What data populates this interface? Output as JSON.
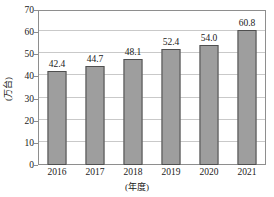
{
  "chart_data": {
    "type": "bar",
    "title": "",
    "categories": [
      "2016",
      "2017",
      "2018",
      "2019",
      "2020",
      "2021"
    ],
    "values": [
      42.4,
      44.7,
      48.1,
      52.4,
      54.0,
      60.8
    ],
    "value_labels": [
      "42.4",
      "44.7",
      "48.1",
      "52.4",
      "54.0",
      "60.8"
    ],
    "xlabel": "(年度)",
    "ylabel": "(万台)",
    "ylim": [
      0,
      70
    ],
    "ytick_labels": [
      "0",
      "10",
      "20",
      "30",
      "40",
      "50",
      "60",
      "70"
    ],
    "ytick_values": [
      0,
      10,
      20,
      30,
      40,
      50,
      60,
      70
    ],
    "grid": true,
    "legend": "none",
    "colors": {
      "bar_fill": "#9e9e9e",
      "bar_stroke": "#4f4f4f",
      "gridline": "#c9c9c9",
      "frame": "#8e8e8e",
      "text": "#1a1a1a",
      "background": "#ffffff"
    }
  }
}
